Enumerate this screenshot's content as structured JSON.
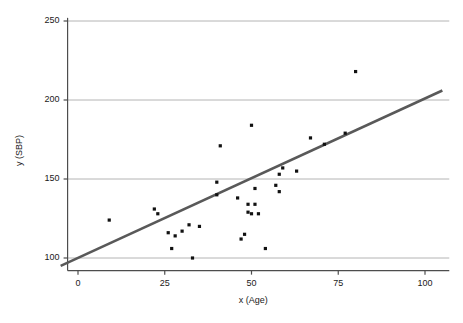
{
  "chart_data": {
    "type": "scatter",
    "title": "",
    "xlabel": "x (Age)",
    "ylabel": "y (SBP)",
    "xlim": [
      -6,
      107
    ],
    "ylim": [
      92,
      252
    ],
    "xticks": [
      0,
      25,
      50,
      75,
      100
    ],
    "yticks": [
      100,
      150,
      200,
      250
    ],
    "xtick_labels": [
      "0",
      "25",
      "50",
      "75",
      "100"
    ],
    "ytick_labels": [
      "100",
      "150",
      "200",
      "250"
    ],
    "grid": "horizontal",
    "legend": "none",
    "marker_color": "#111111",
    "marker_shape": "square",
    "line_color": "#595959",
    "grid_color": "#b4b4b4",
    "axis_color": "#4d4d4d",
    "points": [
      {
        "x": 9,
        "y": 124
      },
      {
        "x": 22,
        "y": 131
      },
      {
        "x": 23,
        "y": 128
      },
      {
        "x": 26,
        "y": 116
      },
      {
        "x": 27,
        "y": 106
      },
      {
        "x": 28,
        "y": 114
      },
      {
        "x": 30,
        "y": 117
      },
      {
        "x": 32,
        "y": 121
      },
      {
        "x": 33,
        "y": 100
      },
      {
        "x": 35,
        "y": 120
      },
      {
        "x": 40,
        "y": 148
      },
      {
        "x": 40,
        "y": 140
      },
      {
        "x": 41,
        "y": 171
      },
      {
        "x": 46,
        "y": 138
      },
      {
        "x": 47,
        "y": 112
      },
      {
        "x": 48,
        "y": 115
      },
      {
        "x": 49,
        "y": 134
      },
      {
        "x": 49,
        "y": 129
      },
      {
        "x": 50,
        "y": 184
      },
      {
        "x": 50,
        "y": 128
      },
      {
        "x": 51,
        "y": 144
      },
      {
        "x": 51,
        "y": 134
      },
      {
        "x": 52,
        "y": 128
      },
      {
        "x": 54,
        "y": 106
      },
      {
        "x": 57,
        "y": 146
      },
      {
        "x": 58,
        "y": 142
      },
      {
        "x": 58,
        "y": 153
      },
      {
        "x": 59,
        "y": 157
      },
      {
        "x": 63,
        "y": 155
      },
      {
        "x": 67,
        "y": 176
      },
      {
        "x": 71,
        "y": 172
      },
      {
        "x": 77,
        "y": 179
      },
      {
        "x": 80,
        "y": 218
      }
    ],
    "fit_line": {
      "x_start": -5,
      "y_start": 95,
      "x_end": 105,
      "y_end": 206
    }
  }
}
